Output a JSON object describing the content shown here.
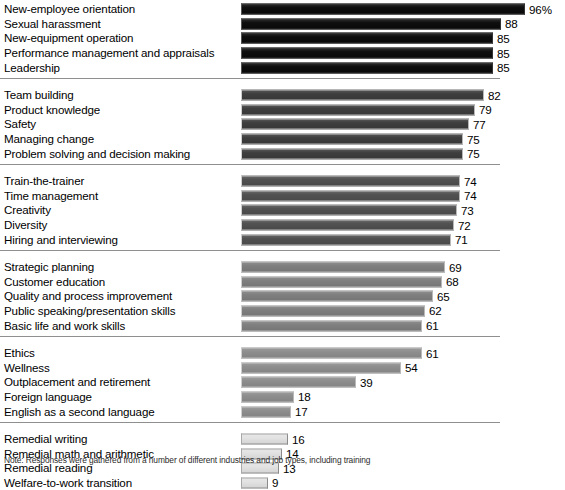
{
  "chart_data": {
    "type": "bar",
    "title": "",
    "subtitle": "",
    "xlabel": "",
    "ylabel": "",
    "orientation": "horizontal",
    "xlim": [
      0,
      100
    ],
    "grid": false,
    "legend": false,
    "value_unit": "percent",
    "note": "Note: Responses were gathered from a number of different industries and job types, including training",
    "categories": [
      "New-employee orientation",
      "Sexual harassment",
      "New-equipment operation",
      "Performance management and appraisals",
      "Leadership",
      "Team building",
      "Product knowledge",
      "Safety",
      "Managing change",
      "Problem solving and decision making",
      "Train-the-trainer",
      "Time management",
      "Creativity",
      "Diversity",
      "Hiring and interviewing",
      "Strategic planning",
      "Customer education",
      "Quality and process improvement",
      "Public speaking/presentation skills",
      "Basic life and work skills",
      "Ethics",
      "Wellness",
      "Outplacement and retirement",
      "Foreign language",
      "English as a second language",
      "Remedial writing",
      "Remedial math and arithmetic",
      "Remedial reading",
      "Welfare-to-work transition"
    ],
    "values": [
      96,
      88,
      85,
      85,
      85,
      82,
      79,
      77,
      75,
      75,
      74,
      74,
      73,
      72,
      71,
      69,
      68,
      65,
      62,
      61,
      61,
      54,
      39,
      18,
      17,
      16,
      14,
      13,
      9
    ],
    "value_labels": [
      "96%",
      "88",
      "85",
      "85",
      "85",
      "82",
      "79",
      "77",
      "75",
      "75",
      "74",
      "74",
      "73",
      "72",
      "71",
      "69",
      "68",
      "65",
      "62",
      "61",
      "61",
      "54",
      "39",
      "18",
      "17",
      "16",
      "14",
      "13",
      "9"
    ]
  },
  "groups": [
    {
      "id": "group-1",
      "color": "#0a0a0a",
      "rows": [
        {
          "label": "New-employee orientation",
          "value": 96,
          "value_label": "96%"
        },
        {
          "label": "Sexual harassment",
          "value": 88,
          "value_label": "88"
        },
        {
          "label": "New-equipment operation",
          "value": 85,
          "value_label": "85"
        },
        {
          "label": "Performance management and appraisals",
          "value": 85,
          "value_label": "85"
        },
        {
          "label": "Leadership",
          "value": 85,
          "value_label": "85"
        }
      ]
    },
    {
      "id": "group-2",
      "color": "#3b3b3b",
      "rows": [
        {
          "label": "Team building",
          "value": 82,
          "value_label": "82"
        },
        {
          "label": "Product knowledge",
          "value": 79,
          "value_label": "79"
        },
        {
          "label": "Safety",
          "value": 77,
          "value_label": "77"
        },
        {
          "label": "Managing change",
          "value": 75,
          "value_label": "75"
        },
        {
          "label": "Problem solving and decision making",
          "value": 75,
          "value_label": "75"
        }
      ]
    },
    {
      "id": "group-3",
      "color": "#4e4e4e",
      "rows": [
        {
          "label": "Train-the-trainer",
          "value": 74,
          "value_label": "74"
        },
        {
          "label": "Time management",
          "value": 74,
          "value_label": "74"
        },
        {
          "label": "Creativity",
          "value": 73,
          "value_label": "73"
        },
        {
          "label": "Diversity",
          "value": 72,
          "value_label": "72"
        },
        {
          "label": "Hiring and interviewing",
          "value": 71,
          "value_label": "71"
        }
      ]
    },
    {
      "id": "group-4",
      "color": "#7d7d7d",
      "rows": [
        {
          "label": "Strategic planning",
          "value": 69,
          "value_label": "69"
        },
        {
          "label": "Customer education",
          "value": 68,
          "value_label": "68"
        },
        {
          "label": "Quality and process improvement",
          "value": 65,
          "value_label": "65"
        },
        {
          "label": "Public speaking/presentation skills",
          "value": 62,
          "value_label": "62"
        },
        {
          "label": "Basic life and work skills",
          "value": 61,
          "value_label": "61"
        }
      ]
    },
    {
      "id": "group-5",
      "color": "#8c8c8c",
      "rows": [
        {
          "label": "Ethics",
          "value": 61,
          "value_label": "61"
        },
        {
          "label": "Wellness",
          "value": 54,
          "value_label": "54"
        },
        {
          "label": "Outplacement and retirement",
          "value": 39,
          "value_label": "39"
        },
        {
          "label": "Foreign language",
          "value": 18,
          "value_label": "18"
        },
        {
          "label": "English as a second language",
          "value": 17,
          "value_label": "17"
        }
      ]
    },
    {
      "id": "group-6",
      "color": "#e2e2e2",
      "rows": [
        {
          "label": "Remedial writing",
          "value": 16,
          "value_label": "16"
        },
        {
          "label": "Remedial math and arithmetic",
          "value": 14,
          "value_label": "14"
        },
        {
          "label": "Remedial reading",
          "value": 13,
          "value_label": "13"
        },
        {
          "label": "Welfare-to-work transition",
          "value": 9,
          "value_label": "9"
        }
      ]
    }
  ],
  "footnote": "Note: Responses were gathered from a number of different industries and job types, including training"
}
